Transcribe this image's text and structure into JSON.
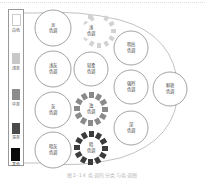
{
  "scale": {
    "items": [
      {
        "label": "白色",
        "color": "#ffffff",
        "top": 8
      },
      {
        "label": "浅灰",
        "color": "#c8c8c8",
        "top": 45
      },
      {
        "label": "中灰",
        "color": "#8c8c8c",
        "top": 80
      },
      {
        "label": "深灰",
        "color": "#4a4a4a",
        "top": 113
      },
      {
        "label": "黑色",
        "color": "#0a0a0a",
        "top": 146
      }
    ]
  },
  "tones": {
    "pale": {
      "label": "淡\n色调"
    },
    "light_grayish": {
      "label": "浅灰\n色调"
    },
    "grayish": {
      "label": "灰\n色调"
    },
    "dark_grayish": {
      "label": "暗灰\n色调"
    },
    "light": {
      "label": "浅\n色调"
    },
    "soft": {
      "label": "轻柔\n色调"
    },
    "dull": {
      "label": "浊\n色调"
    },
    "dark": {
      "label": "暗\n色调"
    },
    "bright": {
      "label": "明亮\n色调"
    },
    "strong": {
      "label": "强烈\n色调"
    },
    "deep": {
      "label": "深\n色调"
    },
    "vivid": {
      "label": "鲜艳\n色调"
    }
  },
  "colors": {
    "light_rays": "#d2d2d2",
    "dull_rays": "#8a8a8a",
    "dark_rays": "#3c3c3c",
    "outline": "#888888"
  },
  "caption": "图2-14  色调的分类与色调图"
}
